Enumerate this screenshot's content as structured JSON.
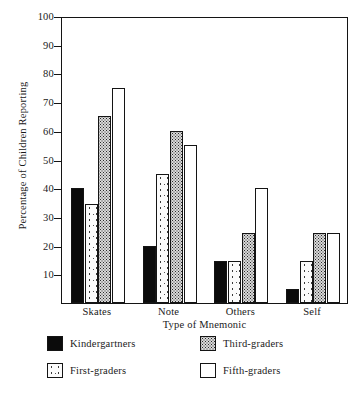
{
  "chart_data": {
    "type": "bar",
    "title": "",
    "xlabel": "Type of Mnemonic",
    "ylabel": "Percentage of Children Reporting",
    "categories": [
      "Skates",
      "Note",
      "Others",
      "Self"
    ],
    "ylim": [
      0,
      100
    ],
    "yticks": [
      10,
      20,
      30,
      40,
      50,
      60,
      70,
      80,
      90,
      100
    ],
    "grid": false,
    "legend_position": "below-plot",
    "series": [
      {
        "name": "Kindergartners",
        "pattern": "solid-black",
        "values": [
          40,
          20,
          14.5,
          5
        ]
      },
      {
        "name": "First-graders",
        "pattern": "sparse-speckle",
        "values": [
          34.5,
          45,
          14.5,
          14.5
        ]
      },
      {
        "name": "Third-graders",
        "pattern": "dense-checker",
        "values": [
          65,
          60,
          24.5,
          24.5
        ]
      },
      {
        "name": "Fifth-graders",
        "pattern": "open-white",
        "values": [
          75,
          55,
          40,
          24.5
        ]
      }
    ]
  },
  "legend": {
    "items": [
      {
        "label": "Kindergartners"
      },
      {
        "label": "Third-graders"
      },
      {
        "label": "First-graders"
      },
      {
        "label": "Fifth-graders"
      }
    ]
  }
}
